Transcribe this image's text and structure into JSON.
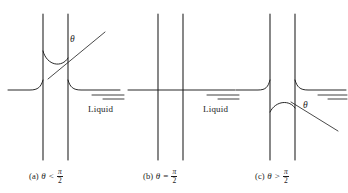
{
  "figure": {
    "background_color": "#ffffff",
    "line_color": "#1c1c1c",
    "width": 348,
    "height": 193
  },
  "panels": [
    {
      "id": "a",
      "tag": "(a)",
      "theta_symbol": "θ",
      "relation": "<",
      "frac_num": "π",
      "frac_den": "2",
      "caption_plain": "(a) θ < π/2",
      "theta_mark": "θ",
      "liquid_label": "Liquid",
      "meniscus": "concave-up",
      "description": "Liquid rises in the capillary tube; wetting case"
    },
    {
      "id": "b",
      "tag": "(b)",
      "theta_symbol": "θ",
      "relation": "=",
      "frac_num": "π",
      "frac_den": "2",
      "caption_plain": "(b) θ = π/2",
      "theta_mark": "",
      "liquid_label": "Liquid",
      "meniscus": "flat",
      "description": "Liquid level inside the tube equals the outside level"
    },
    {
      "id": "c",
      "tag": "(c)",
      "theta_symbol": "θ",
      "relation": ">",
      "frac_num": "π",
      "frac_den": "2",
      "caption_plain": "(c) θ > π/2",
      "theta_mark": "θ",
      "liquid_label": "",
      "meniscus": "convex-down",
      "description": "Liquid is depressed in the capillary tube; non-wetting case"
    }
  ]
}
